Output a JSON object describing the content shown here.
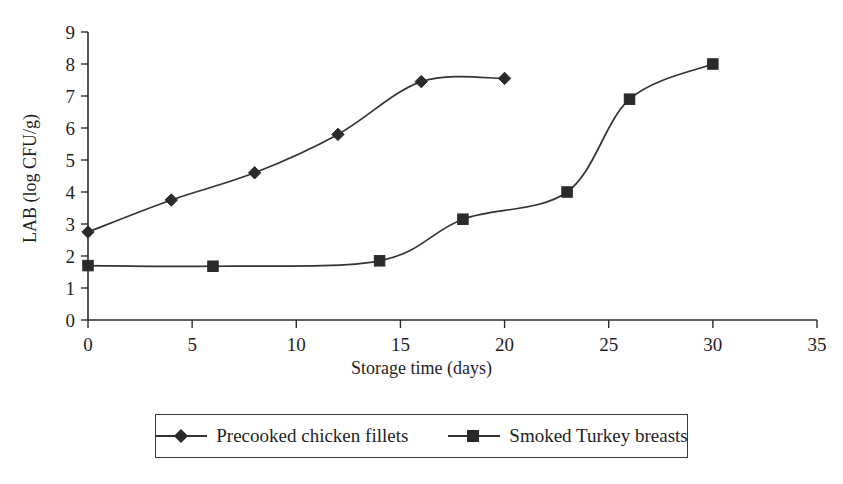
{
  "chart_data": {
    "type": "line",
    "title": "",
    "xlabel": "Storage time (days)",
    "ylabel": "LAB (log CFU/g)",
    "xlim": [
      0,
      35
    ],
    "ylim": [
      0,
      9
    ],
    "xticks": [
      0,
      5,
      10,
      15,
      20,
      25,
      30,
      35
    ],
    "yticks": [
      0,
      1,
      2,
      3,
      4,
      5,
      6,
      7,
      8,
      9
    ],
    "xtick_labels": [
      "0",
      "5",
      "10",
      "15",
      "20",
      "25",
      "30",
      "35"
    ],
    "ytick_labels": [
      "0",
      "1",
      "2",
      "3",
      "4",
      "5",
      "6",
      "7",
      "8",
      "9"
    ],
    "grid": false,
    "legend_position": "bottom-center",
    "series": [
      {
        "name": "Precooked chicken fillets",
        "marker": "diamond",
        "color": "#2a2a2a",
        "x": [
          0,
          4,
          8,
          12,
          16,
          20
        ],
        "y": [
          2.75,
          3.75,
          4.6,
          5.8,
          7.45,
          7.55
        ]
      },
      {
        "name": "Smoked Turkey breasts",
        "marker": "square",
        "color": "#2a2a2a",
        "x": [
          0,
          6,
          14,
          18,
          23,
          26,
          30
        ],
        "y": [
          1.7,
          1.68,
          1.85,
          3.15,
          4.0,
          6.9,
          8.0
        ]
      }
    ]
  },
  "legend": {
    "entries": [
      {
        "label": "Precooked chicken fillets",
        "marker": "diamond-marker"
      },
      {
        "label": "Smoked Turkey breasts",
        "marker": "square-marker"
      }
    ]
  },
  "axes": {
    "x_title": "Storage time (days)",
    "y_title": "LAB (log CFU/g)"
  }
}
